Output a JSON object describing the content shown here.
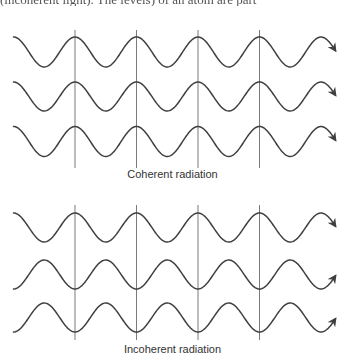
{
  "top_text": "(incoherent light). The levels) of an atom are part",
  "colors": {
    "wave": "#3f3f3f",
    "guide": "#7a7a7a",
    "background": "#ffffff"
  },
  "panels": [
    {
      "caption": "Coherent radiation",
      "caption_y": 168,
      "guide_lines": {
        "x": [
          75,
          136.5,
          198,
          259.5
        ],
        "y_top": 30,
        "y_bottom": 168
      },
      "waves": [
        {
          "center_y": 52,
          "amplitude": 15,
          "peak_x": 13.5,
          "x_start": 13.5,
          "x_end": 336
        },
        {
          "center_y": 96.5,
          "amplitude": 14.5,
          "peak_x": 13.5,
          "x_start": 13.5,
          "x_end": 336
        },
        {
          "center_y": 141.5,
          "amplitude": 15,
          "peak_x": 13.5,
          "x_start": 13.5,
          "x_end": 336
        }
      ]
    },
    {
      "caption": "Incoherent radiation",
      "caption_y": 343,
      "guide_lines": {
        "x": [
          75,
          136.5,
          198,
          259.5
        ],
        "y_top": 205,
        "y_bottom": 340
      },
      "waves": [
        {
          "center_y": 227.5,
          "amplitude": 14.5,
          "peak_x": 13.5,
          "x_start": 13.5,
          "x_end": 336
        },
        {
          "center_y": 274.5,
          "amplitude": 14.5,
          "peak_x": 44.25,
          "x_start": 13.5,
          "x_end": 336
        },
        {
          "center_y": 317.5,
          "amplitude": 14.5,
          "peak_x": 44.25,
          "x_start": 13.5,
          "x_end": 336
        }
      ]
    }
  ],
  "period": 61.5
}
